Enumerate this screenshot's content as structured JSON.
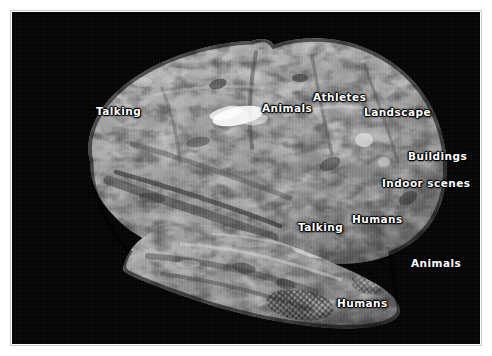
{
  "figure": {
    "domain": "brain-semantic-map",
    "caption_text": "",
    "background_color": "#050505",
    "mat_color": "#ffffff",
    "rule_color": "#c9c9c9",
    "label_color": "#ffffff"
  },
  "labels": [
    {
      "id": "talking-frontal",
      "text": "Talking",
      "x": 96,
      "y": 100
    },
    {
      "id": "animals-superior",
      "text": "Animals",
      "x": 262,
      "y": 97
    },
    {
      "id": "athletes",
      "text": "Athletes",
      "x": 313,
      "y": 86
    },
    {
      "id": "landscape",
      "text": "Landscape",
      "x": 364,
      "y": 101
    },
    {
      "id": "buildings",
      "text": "Buildings",
      "x": 408,
      "y": 145
    },
    {
      "id": "indoor-scenes",
      "text": "Indoor scenes",
      "x": 382,
      "y": 172
    },
    {
      "id": "talking-temporal",
      "text": "Talking",
      "x": 298,
      "y": 216
    },
    {
      "id": "humans-lateral",
      "text": "Humans",
      "x": 352,
      "y": 208
    },
    {
      "id": "animals-posterior",
      "text": "Animals",
      "x": 411,
      "y": 252
    },
    {
      "id": "humans-inferior",
      "text": "Humans",
      "x": 337,
      "y": 292
    }
  ],
  "label_categories": [
    "Talking",
    "Animals",
    "Athletes",
    "Landscape",
    "Buildings",
    "Indoor scenes",
    "Humans"
  ]
}
